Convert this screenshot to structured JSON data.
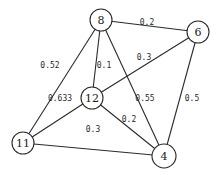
{
  "graph": {
    "nodes": [
      {
        "id": "8",
        "label": "8",
        "x": 101,
        "y": 20,
        "r": 11
      },
      {
        "id": "6",
        "label": "6",
        "x": 198,
        "y": 32,
        "r": 11
      },
      {
        "id": "12",
        "label": "12",
        "x": 92,
        "y": 98,
        "r": 11
      },
      {
        "id": "11",
        "label": "11",
        "x": 23,
        "y": 143,
        "r": 11
      },
      {
        "id": "4",
        "label": "4",
        "x": 164,
        "y": 156,
        "r": 12
      }
    ],
    "edges": [
      {
        "from": "8",
        "to": "6",
        "weight": "0.2",
        "lx": 147,
        "ly": 22
      },
      {
        "from": "8",
        "to": "11",
        "weight": "0.52",
        "lx": 50,
        "ly": 65
      },
      {
        "from": "8",
        "to": "12",
        "weight": "0.1",
        "lx": 104,
        "ly": 65
      },
      {
        "from": "8",
        "to": "4",
        "weight": "0.55",
        "lx": 145,
        "ly": 98
      },
      {
        "from": "6",
        "to": "12",
        "weight": "0.3",
        "lx": 144,
        "ly": 57
      },
      {
        "from": "6",
        "to": "4",
        "weight": "0.5",
        "lx": 192,
        "ly": 98
      },
      {
        "from": "12",
        "to": "11",
        "weight": "0.633",
        "lx": 60,
        "ly": 98
      },
      {
        "from": "12",
        "to": "4",
        "weight": "0.2",
        "lx": 129,
        "ly": 119
      },
      {
        "from": "11",
        "to": "4",
        "weight": "0.3",
        "lx": 93,
        "ly": 129
      }
    ]
  }
}
